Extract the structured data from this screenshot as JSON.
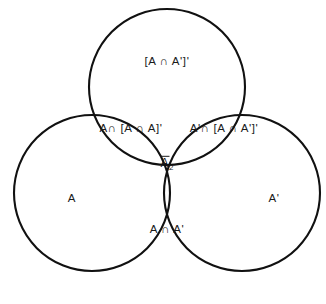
{
  "diagram": {
    "type": "venn",
    "set_count": 3,
    "background_color": "#ffffff",
    "stroke_color": "#111111",
    "circles": [
      {
        "name": "top-circle",
        "cx": 167,
        "cy": 87,
        "r": 78
      },
      {
        "name": "left-circle",
        "cx": 92,
        "cy": 193,
        "r": 78
      },
      {
        "name": "right-circle",
        "cx": 242,
        "cy": 193,
        "r": 78
      }
    ],
    "labels": {
      "top": "[A ∩ A']'",
      "left_middle": "A∩ [A ∩ A]'",
      "right_middle": "A'∩ [A ∩ A']'",
      "center_base": "A",
      "center_subscript": "2",
      "bottom": "A ∩ A'",
      "left_circle": "A",
      "right_circle": "A'"
    }
  }
}
